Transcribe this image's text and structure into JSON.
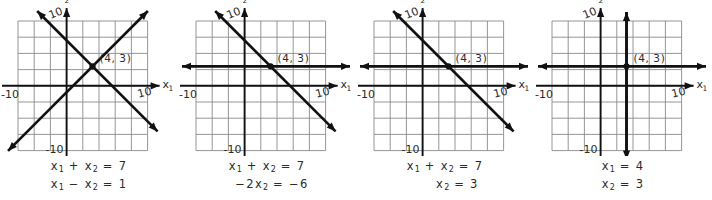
{
  "figure": {
    "title": "",
    "panel_count": 4,
    "colors": {
      "grid": "#8a8a8a",
      "axis": "#1a1a1a",
      "line": "#111111",
      "text": "#2b2b2b",
      "background": "#ffffff"
    }
  },
  "chart_data": {
    "type": "line",
    "title": "",
    "xlabel": "x_1",
    "ylabel": "x_2",
    "xlim": [
      -12,
      12
    ],
    "ylim": [
      -12,
      12
    ],
    "grid": true,
    "legend": "none",
    "panels": [
      {
        "id": "panel-1",
        "xlabel": "x",
        "xlabel_sub": "1",
        "ylabel": "x",
        "ylabel_sub": "2",
        "x_tick_labels": [
          "-10",
          "10"
        ],
        "y_tick_labels": [
          "10",
          "-10"
        ],
        "point": {
          "label": "(4,  3)",
          "x": 4,
          "y": 3
        },
        "equations": [
          {
            "parts": [
              {
                "t": "x",
                "sub": "1"
              },
              {
                "t": " + "
              },
              {
                "t": "x",
                "sub": "2"
              },
              {
                "t": " = 7"
              }
            ]
          },
          {
            "parts": [
              {
                "t": "x",
                "sub": "1"
              },
              {
                "t": " − "
              },
              {
                "t": "x",
                "sub": "2"
              },
              {
                "t": " = 1"
              }
            ]
          }
        ],
        "series": [
          {
            "name": "x1 + x2 = 7",
            "kind": "diagonal-down",
            "slope": -1,
            "intercept": 7,
            "arrows": "both"
          },
          {
            "name": "x1 - x2 = 1",
            "kind": "diagonal-up",
            "slope": 1,
            "intercept": -1,
            "arrows": "both"
          }
        ]
      },
      {
        "id": "panel-2",
        "xlabel": "x",
        "xlabel_sub": "1",
        "ylabel": "x",
        "ylabel_sub": "2",
        "x_tick_labels": [
          "-10",
          "10"
        ],
        "y_tick_labels": [
          "10",
          "-10"
        ],
        "point": {
          "label": "(4,  3)",
          "x": 4,
          "y": 3
        },
        "equations": [
          {
            "parts": [
              {
                "t": "x",
                "sub": "1"
              },
              {
                "t": " + "
              },
              {
                "t": "x",
                "sub": "2"
              },
              {
                "t": " = 7"
              }
            ]
          },
          {
            "parts": [
              {
                "t": "  −2x",
                "sub": "2"
              },
              {
                "t": " = −6"
              }
            ]
          }
        ],
        "series": [
          {
            "name": "x1 + x2 = 7",
            "kind": "diagonal-down",
            "slope": -1,
            "intercept": 7,
            "arrows": "both"
          },
          {
            "name": "-2x2 = -6",
            "kind": "horizontal",
            "y": 3,
            "arrows": "both"
          }
        ]
      },
      {
        "id": "panel-3",
        "xlabel": "x",
        "xlabel_sub": "1",
        "ylabel": "x",
        "ylabel_sub": "2",
        "x_tick_labels": [
          "-10",
          "10"
        ],
        "y_tick_labels": [
          "10",
          "-10"
        ],
        "point": {
          "label": "(4,  3)",
          "x": 4,
          "y": 3
        },
        "equations": [
          {
            "parts": [
              {
                "t": "x",
                "sub": "1"
              },
              {
                "t": " + "
              },
              {
                "t": "x",
                "sub": "2"
              },
              {
                "t": " = 7"
              }
            ]
          },
          {
            "parts": [
              {
                "t": "     x",
                "sub": "2"
              },
              {
                "t": " = 3"
              }
            ]
          }
        ],
        "series": [
          {
            "name": "x1 + x2 = 7",
            "kind": "diagonal-down",
            "slope": -1,
            "intercept": 7,
            "arrows": "both"
          },
          {
            "name": "x2 = 3",
            "kind": "horizontal",
            "y": 3,
            "arrows": "both"
          }
        ]
      },
      {
        "id": "panel-4",
        "xlabel": "x",
        "xlabel_sub": "1",
        "ylabel": "x",
        "ylabel_sub": "2",
        "x_tick_labels": [
          "-10",
          "10"
        ],
        "y_tick_labels": [
          "10",
          "-10"
        ],
        "point": {
          "label": "(4,  3)",
          "x": 4,
          "y": 3
        },
        "equations": [
          {
            "parts": [
              {
                "t": "x",
                "sub": "1"
              },
              {
                "t": " = 4"
              }
            ]
          },
          {
            "parts": [
              {
                "t": "x",
                "sub": "2"
              },
              {
                "t": " = 3"
              }
            ]
          }
        ],
        "series": [
          {
            "name": "x1 = 4",
            "kind": "vertical",
            "x": 4,
            "arrows": "both"
          },
          {
            "name": "x2 = 3",
            "kind": "horizontal",
            "y": 3,
            "arrows": "both"
          }
        ]
      }
    ]
  }
}
